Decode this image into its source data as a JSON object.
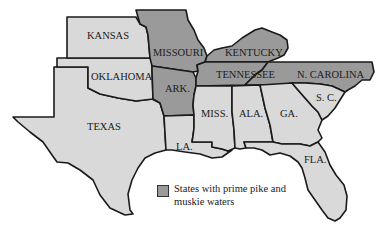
{
  "map": {
    "colors": {
      "prime_waters": "#9a9a9a",
      "other_states": "#d9d9d9",
      "border": "#1a1a1a"
    },
    "states": {
      "kansas": {
        "label": "KANSAS",
        "prime": false
      },
      "oklahoma": {
        "label": "OKLAHOMA",
        "prime": false
      },
      "texas": {
        "label": "TEXAS",
        "prime": false
      },
      "missouri": {
        "label": "MISSOURI",
        "prime": true
      },
      "arkansas": {
        "label": "ARK.",
        "prime": true
      },
      "louisiana": {
        "label": "LA.",
        "prime": false
      },
      "kentucky": {
        "label": "KENTUCKY",
        "prime": true
      },
      "tennessee": {
        "label": "TENNESSEE",
        "prime": true
      },
      "north_carolina": {
        "label": "N. CAROLINA",
        "prime": true
      },
      "mississippi": {
        "label": "MISS.",
        "prime": false
      },
      "alabama": {
        "label": "ALA.",
        "prime": false
      },
      "georgia": {
        "label": "GA.",
        "prime": false
      },
      "south_carolina": {
        "label": "S. C.",
        "prime": false
      },
      "florida": {
        "label": "FLA.",
        "prime": false
      }
    },
    "legend": {
      "line1": "States with prime pike and",
      "line2": "muskie waters"
    }
  }
}
